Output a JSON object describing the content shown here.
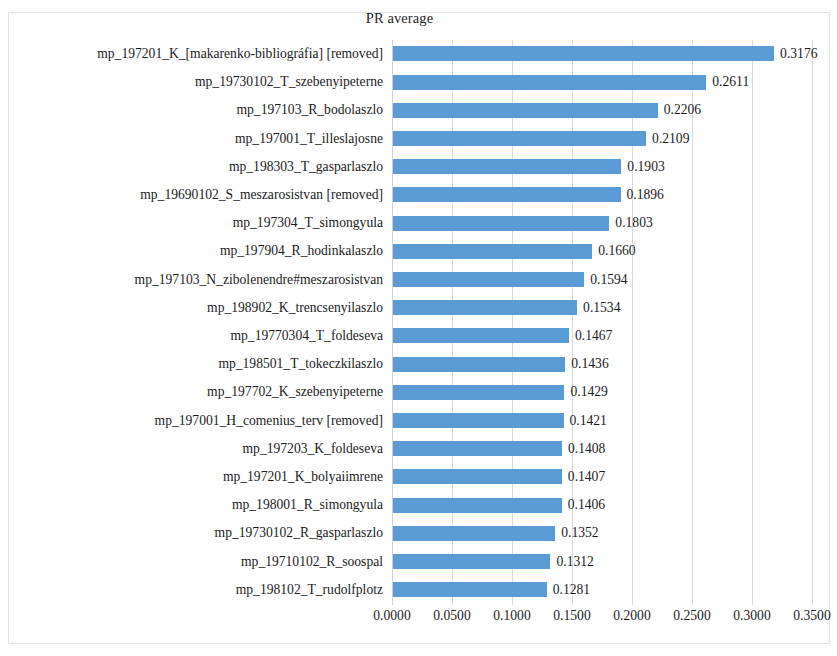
{
  "chart_data": {
    "type": "bar",
    "orientation": "horizontal",
    "title": "PR average",
    "xlabel": "",
    "ylabel": "",
    "xlim": [
      0.0,
      0.35
    ],
    "xticks": [
      "0.0000",
      "0.0500",
      "0.1000",
      "0.1500",
      "0.2000",
      "0.2500",
      "0.3000",
      "0.3500"
    ],
    "xtick_values": [
      0.0,
      0.05,
      0.1,
      0.15,
      0.2,
      0.25,
      0.3,
      0.35
    ],
    "grid": true,
    "legend": false,
    "bar_color": "#5B9BD5",
    "gridline_color": "#D9D9D9",
    "value_label_format": "0.0000",
    "categories": [
      "mp_197201_K_[makarenko-bibliográfia] [removed]",
      "mp_19730102_T_szebenyipeterne",
      "mp_197103_R_bodolaszlo",
      "mp_197001_T_illeslajosne",
      "mp_198303_T_gasparlaszlo",
      "mp_19690102_S_meszarosistvan [removed]",
      "mp_197304_T_simongyula",
      "mp_197904_R_hodinkalaszlo",
      "mp_197103_N_zibolenendre#meszarosistvan",
      "mp_198902_K_trencsenyilaszlo",
      "mp_19770304_T_foldeseva",
      "mp_198501_T_tokeczkilaszlo",
      "mp_197702_K_szebenyipeterne",
      "mp_197001_H_comenius_terv [removed]",
      "mp_197203_K_foldeseva",
      "mp_197201_K_bolyaiimrene",
      "mp_198001_R_simongyula",
      "mp_19730102_R_gasparlaszlo",
      "mp_19710102_R_soospal",
      "mp_198102_T_rudolfplotz"
    ],
    "values": [
      0.3176,
      0.2611,
      0.2206,
      0.2109,
      0.1903,
      0.1896,
      0.1803,
      0.166,
      0.1594,
      0.1534,
      0.1467,
      0.1436,
      0.1429,
      0.1421,
      0.1408,
      0.1407,
      0.1406,
      0.1352,
      0.1312,
      0.1281
    ],
    "value_labels": [
      "0.3176",
      "0.2611",
      "0.2206",
      "0.2109",
      "0.1903",
      "0.1896",
      "0.1803",
      "0.1660",
      "0.1594",
      "0.1534",
      "0.1467",
      "0.1436",
      "0.1429",
      "0.1421",
      "0.1408",
      "0.1407",
      "0.1406",
      "0.1352",
      "0.1312",
      "0.1281"
    ]
  }
}
